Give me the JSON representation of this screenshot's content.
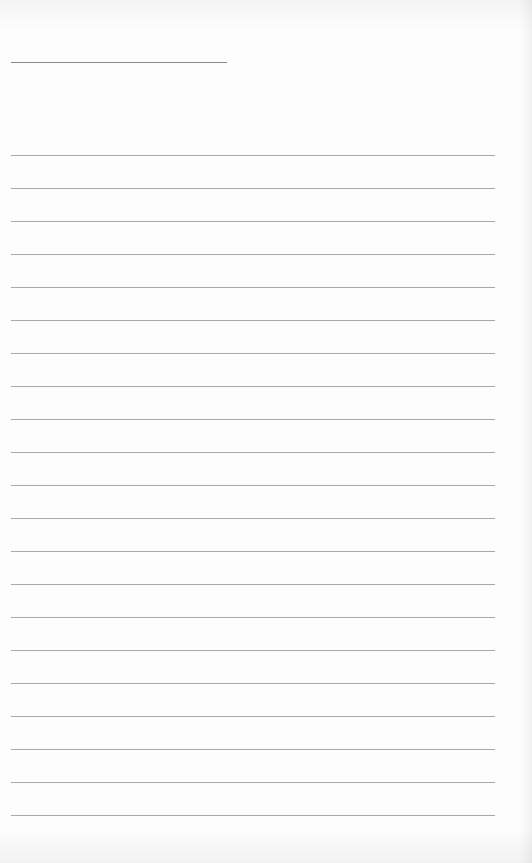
{
  "document": {
    "type": "blank lined paper",
    "header_rule": {
      "present": true
    },
    "ruled_lines": {
      "count": 21,
      "first_y": 155,
      "spacing": 33
    },
    "text_content": ""
  },
  "colors": {
    "paper": "#fdfdfd",
    "rule": "#a9a9a9",
    "header_rule": "#8a8a8a"
  }
}
